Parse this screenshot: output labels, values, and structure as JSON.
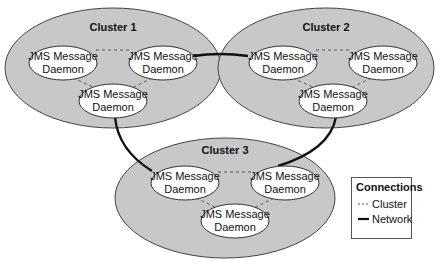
{
  "colors": {
    "cluster_fill": "#c8c8c8",
    "cluster_stroke": "#444444",
    "node_fill": "#ffffff",
    "node_stroke": "#333333",
    "network_line": "#111111",
    "cluster_line": "#555555"
  },
  "clusters": [
    {
      "title": "Cluster 1",
      "nodes": [
        {
          "line1": "JMS Message",
          "line2": "Daemon"
        },
        {
          "line1": "JMS Message",
          "line2": "Daemon"
        },
        {
          "line1": "JMS Message",
          "line2": "Daemon"
        }
      ]
    },
    {
      "title": "Cluster 2",
      "nodes": [
        {
          "line1": "JMS Message",
          "line2": "Daemon"
        },
        {
          "line1": "JMS Message",
          "line2": "Daemon"
        },
        {
          "line1": "JMS Message",
          "line2": "Daemon"
        }
      ]
    },
    {
      "title": "Cluster 3",
      "nodes": [
        {
          "line1": "JMS Message",
          "line2": "Daemon"
        },
        {
          "line1": "JMS Message",
          "line2": "Daemon"
        },
        {
          "line1": "JMS Message",
          "line2": "Daemon"
        }
      ]
    }
  ],
  "legend": {
    "title": "Connections",
    "items": [
      {
        "label": "Cluster",
        "style": "dashed"
      },
      {
        "label": "Network",
        "style": "solid"
      }
    ]
  }
}
